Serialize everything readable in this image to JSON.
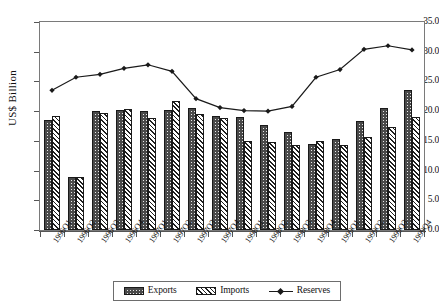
{
  "chart_data": {
    "type": "bar",
    "title": "",
    "xlabel": "",
    "ylabel": "US$ Billion",
    "ylim": [
      0.0,
      35.0
    ],
    "ytick_labels": [
      "0.0",
      "5.0",
      "10.0",
      "15.0",
      "20.0",
      "25.0",
      "30.0",
      "35.0"
    ],
    "ytick_values": [
      0.0,
      5.0,
      10.0,
      15.0,
      20.0,
      25.0,
      30.0,
      35.0
    ],
    "grid": false,
    "legend_position": "bottom",
    "categories": [
      "1996Q1",
      "1996Q2",
      "1996Q3",
      "1996Q4",
      "1997Q1",
      "1997Q2",
      "1997Q3",
      "1997Q4",
      "1998Q1",
      "1998Q2",
      "1998Q3",
      "1998Q4",
      "1999Q1",
      "1999Q2",
      "1999Q3",
      "1999Q4"
    ],
    "series": [
      {
        "name": "Exports",
        "kind": "bar",
        "style": "dotted-dark-fill",
        "values": [
          18.6,
          9.0,
          20.1,
          20.2,
          20.0,
          20.2,
          20.5,
          19.2,
          19.1,
          17.6,
          16.5,
          14.5,
          15.3,
          18.4,
          20.6,
          23.6
        ]
      },
      {
        "name": "Imports",
        "kind": "bar",
        "style": "diagonal-hatch",
        "values": [
          19.2,
          9.0,
          19.7,
          20.3,
          18.9,
          21.7,
          19.5,
          18.9,
          15.0,
          14.8,
          14.3,
          15.0,
          14.3,
          15.6,
          17.3,
          19.0
        ]
      },
      {
        "name": "Reserves",
        "kind": "line",
        "style": "line-with-diamond-markers",
        "values": [
          23.5,
          25.7,
          26.2,
          27.2,
          27.8,
          26.7,
          22.1,
          20.6,
          20.1,
          20.0,
          20.8,
          25.7,
          27.0,
          30.4,
          31.0,
          30.3
        ]
      }
    ]
  },
  "legend": {
    "entries": [
      {
        "label": "Exports",
        "icon": "dotted-swatch-icon"
      },
      {
        "label": "Imports",
        "icon": "hatched-swatch-icon"
      },
      {
        "label": "Reserves",
        "icon": "line-marker-icon"
      }
    ]
  }
}
